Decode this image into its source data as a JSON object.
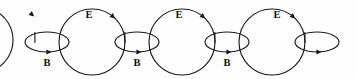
{
  "figure": {
    "type": "diagram",
    "name": "chain-of-loops-diagram",
    "background_color": "#fefefe",
    "stroke_color": "#1a1a1a",
    "label_color": "#0d0d0d",
    "width": 358,
    "height": 79
  },
  "labels": {
    "big_loop": "E",
    "small_loop": "B"
  },
  "nodes": [
    {
      "id": "big-loop-0",
      "shape": "circle",
      "role": "big-loop",
      "label": "",
      "cx": 11,
      "cy": 40,
      "r": 33,
      "partial": true,
      "label_x": 0,
      "label_y": 0,
      "arrow_angle_deg": 310
    },
    {
      "id": "small-loop-1",
      "shape": "ellipse",
      "role": "small-loop",
      "label": "B",
      "cx": 47,
      "cy": 42,
      "rx": 22,
      "ry": 10,
      "partial": false,
      "label_x": 47,
      "label_y": 64,
      "arrow_angle_deg": 90
    },
    {
      "id": "big-loop-1",
      "shape": "circle",
      "role": "big-loop",
      "label": "E",
      "cx": 92,
      "cy": 42,
      "r": 33,
      "partial": false,
      "label_x": 89,
      "label_y": 16,
      "arrow_angle_deg": 310
    },
    {
      "id": "small-loop-2",
      "shape": "ellipse",
      "role": "small-loop",
      "label": "B",
      "cx": 137,
      "cy": 42,
      "rx": 22,
      "ry": 10,
      "partial": false,
      "label_x": 137,
      "label_y": 64,
      "arrow_angle_deg": 90
    },
    {
      "id": "big-loop-2",
      "shape": "circle",
      "role": "big-loop",
      "label": "E",
      "cx": 182,
      "cy": 42,
      "r": 33,
      "partial": false,
      "label_x": 179,
      "label_y": 16,
      "arrow_angle_deg": 310
    },
    {
      "id": "small-loop-3",
      "shape": "ellipse",
      "role": "small-loop",
      "label": "B",
      "cx": 227,
      "cy": 42,
      "rx": 22,
      "ry": 10,
      "partial": false,
      "label_x": 227,
      "label_y": 64,
      "arrow_angle_deg": 90
    },
    {
      "id": "big-loop-3",
      "shape": "circle",
      "role": "big-loop",
      "label": "E",
      "cx": 272,
      "cy": 42,
      "r": 33,
      "partial": false,
      "label_x": 277,
      "label_y": 16,
      "arrow_angle_deg": 310
    },
    {
      "id": "small-loop-4",
      "shape": "ellipse",
      "role": "small-loop",
      "label": "",
      "cx": 317,
      "cy": 42,
      "rx": 22,
      "ry": 10,
      "partial": false,
      "label_x": 0,
      "label_y": 0,
      "arrow_angle_deg": 90
    }
  ]
}
